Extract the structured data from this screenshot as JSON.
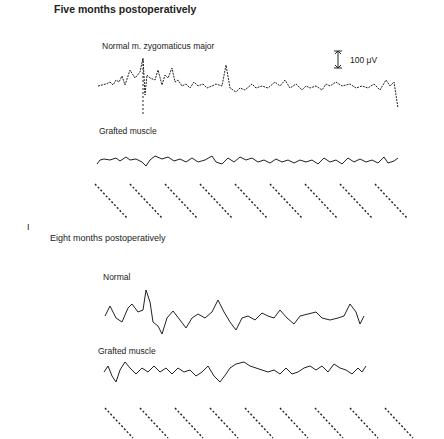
{
  "figure": {
    "panel_top": {
      "title": "Five months postoperatively",
      "trace1_label": "Normal m. zygomaticus major",
      "trace2_label": "Grafted muscle",
      "scale_bar": "100 μV"
    },
    "panel_label": "I",
    "panel_bottom": {
      "title": "Eight months postoperatively",
      "trace1_label": "Normal",
      "trace2_label": "Grafted muscle"
    }
  },
  "colors": {
    "trace": "#222222",
    "background": "#ffffff"
  }
}
